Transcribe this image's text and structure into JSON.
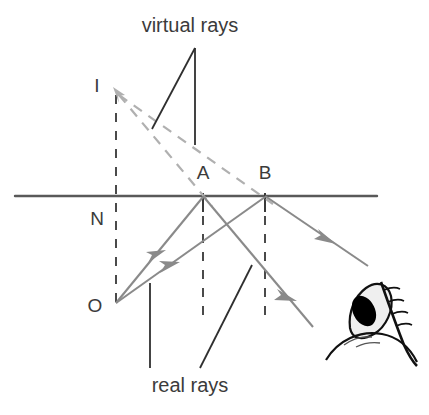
{
  "figure": {
    "title_text": "",
    "type": "optics-ray-diagram",
    "description_topic": "plane mirror reflection — virtual image formation"
  },
  "colors": {
    "mirror_line": "#595959",
    "real_ray": "#8a8a8a",
    "virtual_ray": "#b0b0b0",
    "leader_line": "#2f2f2f",
    "text": "#3b3b3b",
    "dashed_normal": "#4a4a4a",
    "eye_outline": "#111111",
    "eye_sclera": "#efefef",
    "eye_pupil": "#000000",
    "background": "#ffffff"
  },
  "captions": {
    "virtual_rays": "virtual rays",
    "real_rays": "real rays"
  },
  "points": {
    "I": {
      "label": "I",
      "x": 97,
      "y": 92,
      "role": "virtual-image-point"
    },
    "N": {
      "label": "N",
      "x": 97,
      "y": 225,
      "role": "normal-foot-point"
    },
    "O": {
      "label": "O",
      "x": 95,
      "y": 312,
      "role": "object-point"
    },
    "A": {
      "label": "A",
      "x": 203,
      "y": 179,
      "role": "mirror-reflection-point-a"
    },
    "B": {
      "label": "B",
      "x": 265,
      "y": 179,
      "role": "mirror-reflection-point-b"
    }
  },
  "geometry": {
    "mirror_line": {
      "x1": 15,
      "y1": 196,
      "x2": 377,
      "y2": 196
    },
    "normal_dashed": {
      "x": 116,
      "y_top": 95,
      "y_bottom": 303
    },
    "dashed_a": {
      "x": 203,
      "y_top": 196,
      "y_bottom": 322
    },
    "dashed_b": {
      "x": 265,
      "y_top": 196,
      "y_bottom": 322
    },
    "tick_a": {
      "x": 203,
      "y_top": 193,
      "y_bottom": 212
    },
    "tick_b": {
      "x": 265,
      "y_top": 193,
      "y_bottom": 212
    },
    "incident_ray_a": {
      "x1": 116,
      "y1": 303,
      "x2": 203,
      "y2": 196
    },
    "incident_ray_b": {
      "x1": 116,
      "y1": 303,
      "x2": 265,
      "y2": 196
    },
    "reflected_ray_a": {
      "x1": 203,
      "y1": 196,
      "x2": 313,
      "y2": 327
    },
    "reflected_ray_b": {
      "x1": 265,
      "y1": 196,
      "x2": 368,
      "y2": 266
    },
    "virtual_ray_a": {
      "x1": 117,
      "y1": 92,
      "x2": 212,
      "y2": 205
    },
    "virtual_ray_b": {
      "x1": 117,
      "y1": 92,
      "x2": 272,
      "y2": 203
    },
    "virtual_label_leader_left": {
      "x1": 195,
      "y1": 48,
      "x2": 152,
      "y2": 129
    },
    "virtual_label_leader_right": {
      "x1": 195,
      "y1": 48,
      "x2": 195,
      "y2": 145
    },
    "real_label_leader_left": {
      "x1": 150,
      "y1": 283,
      "x2": 150,
      "y2": 368
    },
    "real_label_leader_right": {
      "x1": 252,
      "y1": 265,
      "x2": 200,
      "y2": 368
    }
  },
  "caption_positions": {
    "virtual_rays": {
      "x": 190,
      "y": 32
    },
    "real_rays": {
      "x": 190,
      "y": 392
    }
  },
  "eye": {
    "name": "observer-eye",
    "center_x": 372,
    "center_y": 325
  }
}
